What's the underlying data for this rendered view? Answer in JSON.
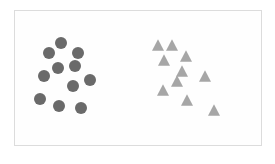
{
  "diagram": {
    "frame": {
      "x": 14,
      "y": 10,
      "width": 248,
      "height": 136
    },
    "colors": {
      "circle": "#6a6a6a",
      "triangle": "#a6a6a6",
      "border": "#dcdcdc"
    },
    "groups": [
      {
        "name": "circles",
        "shape": "circle",
        "radius": 6,
        "points": [
          [
            61,
            43
          ],
          [
            49,
            53
          ],
          [
            78,
            53
          ],
          [
            58,
            68
          ],
          [
            75,
            66
          ],
          [
            44,
            76
          ],
          [
            90,
            80
          ],
          [
            73,
            86
          ],
          [
            40,
            99
          ],
          [
            59,
            106
          ],
          [
            81,
            108
          ]
        ]
      },
      {
        "name": "triangles",
        "shape": "triangle",
        "size": 12,
        "points": [
          [
            158,
            45
          ],
          [
            172,
            45
          ],
          [
            186,
            56
          ],
          [
            164,
            60
          ],
          [
            182,
            71
          ],
          [
            205,
            76
          ],
          [
            177,
            81
          ],
          [
            163,
            90
          ],
          [
            187,
            100
          ],
          [
            214,
            110
          ]
        ]
      }
    ]
  }
}
